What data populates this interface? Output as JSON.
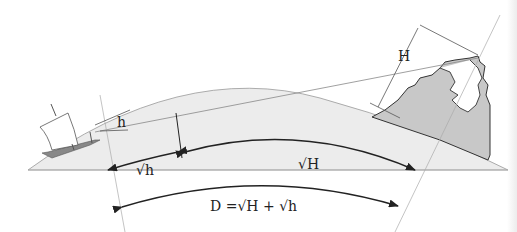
{
  "diagram": {
    "labels": {
      "small_h": "h",
      "big_H": "H",
      "sqrt_h": "√h",
      "sqrt_H": "√H",
      "distance_formula": "D =√H + √h"
    },
    "elements": [
      "ship",
      "mountain",
      "earth-surface-arc",
      "line-of-sight",
      "horizon-tangent-point"
    ],
    "colors": {
      "earth_fill": "#ececec",
      "mountain_fill": "#c8c8c8",
      "line": "#222222",
      "thin_line": "#888888"
    }
  }
}
